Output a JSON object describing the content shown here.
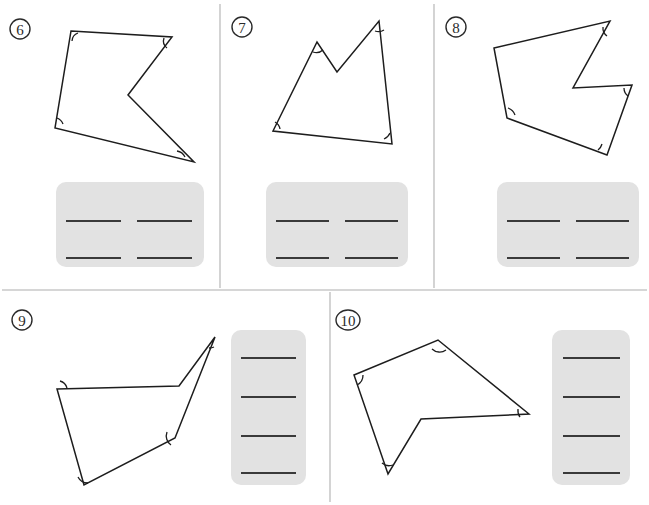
{
  "page": {
    "background_color": "#ffffff",
    "width": 649,
    "height": 505,
    "line_color": "#1d1d1d",
    "divider_color": "#c9c9c9",
    "answer_box_color": "#e2e2e2",
    "answer_line_color": "#3a3a3a"
  },
  "dividers": [
    {
      "name": "vertical-divider-left-top",
      "x1": 220,
      "y1": 4,
      "x2": 220,
      "y2": 288
    },
    {
      "name": "vertical-divider-right-top",
      "x1": 434,
      "y1": 4,
      "x2": 434,
      "y2": 288
    },
    {
      "name": "horizontal-divider-middle",
      "x1": 2,
      "y1": 290,
      "x2": 647,
      "y2": 290
    },
    {
      "name": "vertical-divider-bottom",
      "x1": 330,
      "y1": 292,
      "x2": 330,
      "y2": 502
    }
  ],
  "problems": [
    {
      "number": "6",
      "label_shape": "circle",
      "label_cx": 20,
      "label_cy": 29,
      "label_rx": 10,
      "label_ry": 10,
      "sides": 5,
      "marked_angles": 4,
      "polygon_points": "71,31 172,37 128,95 194,162 55,128",
      "angle_arcs": [
        "M 78,33 A 9,9 0 0 0 72,41",
        "M 164,38 A 9,9 0 0 0 167,48",
        "M 185,157 A 11,11 0 0 0 177,151",
        "M 63,124 A 10,10 0 0 0 57,118"
      ],
      "answer_box": {
        "x": 56,
        "y": 182,
        "width": 148,
        "height": 85,
        "radius": 10,
        "layout": "grid-2x2",
        "lines": [
          {
            "x1": 66,
            "y1": 221,
            "x2": 121,
            "y2": 221
          },
          {
            "x1": 137,
            "y1": 221,
            "x2": 192,
            "y2": 221
          },
          {
            "x1": 66,
            "y1": 258,
            "x2": 121,
            "y2": 258
          },
          {
            "x1": 137,
            "y1": 258,
            "x2": 192,
            "y2": 258
          }
        ]
      }
    },
    {
      "number": "7",
      "label_shape": "circle",
      "label_cx": 242,
      "label_cy": 27,
      "label_rx": 10,
      "label_ry": 10,
      "sides": 5,
      "marked_angles": 4,
      "polygon_points": "273,131 317,42 337,72 379,21 392,144",
      "angle_arcs": [
        "M 280,129 A 10,10 0 0 0 275,122",
        "M 313,52 A 10,10 0 0 0 323,50",
        "M 375,31 A 10,10 0 0 0 384,30",
        "M 384,139 A 11,11 0 0 0 390,133"
      ],
      "answer_box": {
        "x": 266,
        "y": 182,
        "width": 142,
        "height": 85,
        "radius": 10,
        "layout": "grid-2x2",
        "lines": [
          {
            "x1": 276,
            "y1": 221,
            "x2": 329,
            "y2": 221
          },
          {
            "x1": 345,
            "y1": 221,
            "x2": 398,
            "y2": 221
          },
          {
            "x1": 276,
            "y1": 258,
            "x2": 329,
            "y2": 258
          },
          {
            "x1": 345,
            "y1": 258,
            "x2": 398,
            "y2": 258
          }
        ]
      }
    },
    {
      "number": "8",
      "label_shape": "circle",
      "label_cx": 456,
      "label_cy": 27,
      "label_rx": 10,
      "label_ry": 10,
      "sides": 6,
      "marked_angles": 4,
      "polygon_points": "494,48 610,21 573,88 632,85 607,155 507,118",
      "angle_arcs": [
        "M 603,27 A 10,10 0 0 0 607,36",
        "M 624,88 A 10,10 0 0 0 628,96",
        "M 598,150 A 11,11 0 0 0 602,144",
        "M 515,115 A 11,11 0 0 0 508,108"
      ],
      "answer_box": {
        "x": 497,
        "y": 182,
        "width": 142,
        "height": 85,
        "radius": 10,
        "layout": "grid-2x2",
        "lines": [
          {
            "x1": 507,
            "y1": 221,
            "x2": 560,
            "y2": 221
          },
          {
            "x1": 576,
            "y1": 221,
            "x2": 629,
            "y2": 221
          },
          {
            "x1": 507,
            "y1": 258,
            "x2": 560,
            "y2": 258
          },
          {
            "x1": 576,
            "y1": 258,
            "x2": 629,
            "y2": 258
          }
        ]
      }
    },
    {
      "number": "9",
      "label_shape": "circle",
      "label_cx": 22,
      "label_cy": 320,
      "label_rx": 10,
      "label_ry": 10,
      "sides": 5,
      "marked_angles": 4,
      "polygon_points": "57,389 179,386 215,337 175,438 84,485",
      "angle_arcs": [
        "M 67,388 A 10,10 0 0 0 60,381",
        "M 209,348 A 11,11 0 0 0 214,347",
        "M 167,432 A 11,11 0 0 0 171,445",
        "M 78,477 A 11,11 0 0 0 88,483"
      ],
      "answer_box": {
        "x": 231,
        "y": 330,
        "width": 75,
        "height": 155,
        "radius": 10,
        "layout": "stack-4",
        "lines": [
          {
            "x1": 241,
            "y1": 358,
            "x2": 296,
            "y2": 358
          },
          {
            "x1": 241,
            "y1": 397,
            "x2": 296,
            "y2": 397
          },
          {
            "x1": 241,
            "y1": 436,
            "x2": 296,
            "y2": 436
          },
          {
            "x1": 241,
            "y1": 473,
            "x2": 296,
            "y2": 473
          }
        ]
      }
    },
    {
      "number": "10",
      "label_shape": "ellipse",
      "label_cx": 348,
      "label_cy": 320,
      "label_rx": 12,
      "label_ry": 10,
      "sides": 5,
      "marked_angles": 4,
      "polygon_points": "354,375 438,340 529,414 421,419 388,474",
      "angle_arcs": [
        "M 357,385 A 11,11 0 0 0 363,375",
        "M 432,349 A 11,11 0 0 0 446,350",
        "M 518,409 A 11,11 0 0 0 520,417",
        "M 382,463 A 11,11 0 0 0 393,465"
      ],
      "answer_box": {
        "x": 552,
        "y": 330,
        "width": 78,
        "height": 155,
        "radius": 10,
        "layout": "stack-4",
        "lines": [
          {
            "x1": 563,
            "y1": 358,
            "x2": 620,
            "y2": 358
          },
          {
            "x1": 563,
            "y1": 397,
            "x2": 620,
            "y2": 397
          },
          {
            "x1": 563,
            "y1": 436,
            "x2": 620,
            "y2": 436
          },
          {
            "x1": 563,
            "y1": 473,
            "x2": 620,
            "y2": 473
          }
        ]
      }
    }
  ]
}
